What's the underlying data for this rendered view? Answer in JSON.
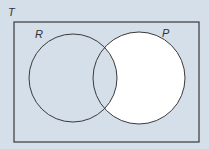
{
  "diagram": {
    "type": "venn",
    "universe": {
      "label": "T",
      "x": 14,
      "y": 22,
      "width": 185,
      "height": 120
    },
    "sets": [
      {
        "label": "R",
        "cx": 73,
        "cy": 78,
        "r": 44,
        "label_x": 35,
        "label_y": 38
      },
      {
        "label": "P",
        "cx": 139,
        "cy": 78,
        "r": 46,
        "label_x": 162,
        "label_y": 37
      }
    ],
    "shaded_region": "P minus R",
    "colors": {
      "background": "#d5dfe9",
      "shaded": "#ffffff",
      "stroke": "#3a3a3a"
    }
  }
}
